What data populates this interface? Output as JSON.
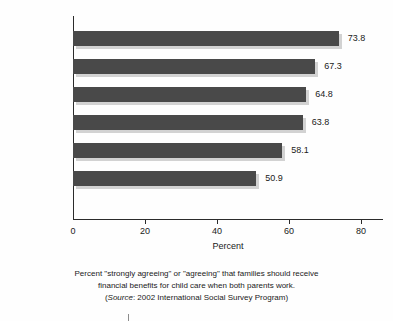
{
  "chart_data": {
    "type": "bar",
    "orientation": "horizontal",
    "title": "",
    "xlabel": "Percent",
    "ylabel": "",
    "xlim": [
      0,
      80
    ],
    "xticks": [
      "0",
      "20",
      "40",
      "60",
      "80"
    ],
    "xtick_values": [
      0,
      20,
      40,
      60,
      80
    ],
    "grid": false,
    "legend": "none",
    "categories": [
      "FRANCE",
      "GERMANY",
      "GREAT BRITAIN",
      "SWEDEN",
      "JAPAN",
      "UNITED STATES"
    ],
    "values": [
      73.8,
      67.3,
      64.8,
      63.8,
      58.1,
      50.9
    ],
    "value_labels": [
      "73.8",
      "67.3",
      "64.8",
      "63.8",
      "58.1",
      "50.9"
    ],
    "bar_color": "#494949",
    "bar_shadow_color": "#d2d2d2",
    "axis_color": "#2b2b2b"
  },
  "caption": {
    "line1": "Percent \"strongly agreeing\" or \"agreeing\" that families should receive",
    "line2": "financial benefits for child care when both parents work.",
    "source_prefix": "(",
    "source_word": "Source",
    "source_rest": ": 2002 International Social Survey Program)"
  }
}
